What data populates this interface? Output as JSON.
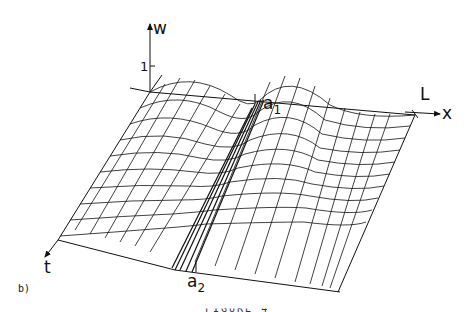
{
  "figure": {
    "panel_label": "b)",
    "caption_partial": "FIGURE 4",
    "axes": {
      "w": "w",
      "x": "x",
      "t": "t",
      "w_tick": "1"
    },
    "markers": {
      "a1": {
        "base": "a",
        "sub": "1"
      },
      "a2": {
        "base": "a",
        "sub": "2"
      },
      "L": "L"
    },
    "colors": {
      "line": "#111111",
      "background": "#ffffff"
    }
  }
}
